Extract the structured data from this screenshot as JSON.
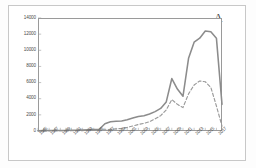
{
  "panel": {
    "label": "A"
  },
  "legend": {
    "position": "top-center",
    "entries": [
      {
        "name": "Humans",
        "style": "solid",
        "color": "#8c8c8c"
      },
      {
        "name": "Animals",
        "style": "dashed",
        "color": "#9a9a9a"
      }
    ]
  },
  "axes": {
    "y_ticks": [
      "0",
      "2000",
      "4000",
      "6000",
      "8000",
      "10000",
      "12000",
      "14000"
    ],
    "x_ticks": [
      "1985",
      "1987",
      "1989",
      "1991",
      "1993",
      "1995",
      "1997",
      "1999",
      "2001",
      "2003",
      "2005",
      "2007",
      "2009",
      "2011",
      "2013",
      "2015",
      "2017"
    ]
  },
  "colors": {
    "humans_line": "#8c8c8c",
    "animals_line": "#9a9a9a",
    "axis": "#9a9a9a",
    "text": "#4a4a4a",
    "outer_border": "#c8c8c8",
    "background": "#ffffff"
  },
  "chart_data": {
    "type": "line",
    "title": "",
    "subtitle": "",
    "xlabel": "",
    "ylabel": "",
    "panel_label": "A",
    "xlim": [
      1985,
      2018
    ],
    "ylim": [
      0,
      14000
    ],
    "ytick_interval": 2000,
    "xtick_interval": 2,
    "grid": false,
    "legend_position": "top-center",
    "x": [
      1985,
      1986,
      1987,
      1988,
      1989,
      1990,
      1991,
      1992,
      1993,
      1994,
      1995,
      1996,
      1997,
      1998,
      1999,
      2000,
      2001,
      2002,
      2003,
      2004,
      2005,
      2006,
      2007,
      2008,
      2009,
      2010,
      2011,
      2012,
      2013,
      2014,
      2015,
      2016,
      2017,
      2018
    ],
    "series": [
      {
        "name": "Humans",
        "style": "solid",
        "color": "#8c8c8c",
        "values": [
          40,
          45,
          50,
          55,
          60,
          70,
          80,
          90,
          110,
          140,
          170,
          210,
          900,
          1150,
          1200,
          1250,
          1400,
          1600,
          1800,
          1900,
          2100,
          2400,
          2800,
          3600,
          6500,
          5200,
          4300,
          9000,
          11000,
          11500,
          12400,
          12300,
          11500,
          3300
        ]
      },
      {
        "name": "Animals",
        "style": "dashed",
        "color": "#9a9a9a",
        "values": [
          20,
          22,
          25,
          28,
          30,
          35,
          40,
          45,
          55,
          70,
          85,
          100,
          150,
          200,
          260,
          330,
          450,
          620,
          800,
          950,
          1150,
          1500,
          1900,
          2600,
          3900,
          3300,
          2900,
          4600,
          5700,
          6200,
          6100,
          5400,
          3100,
          600
        ]
      }
    ],
    "annotations": [
      {
        "text": "A",
        "position": "top-right"
      }
    ]
  }
}
